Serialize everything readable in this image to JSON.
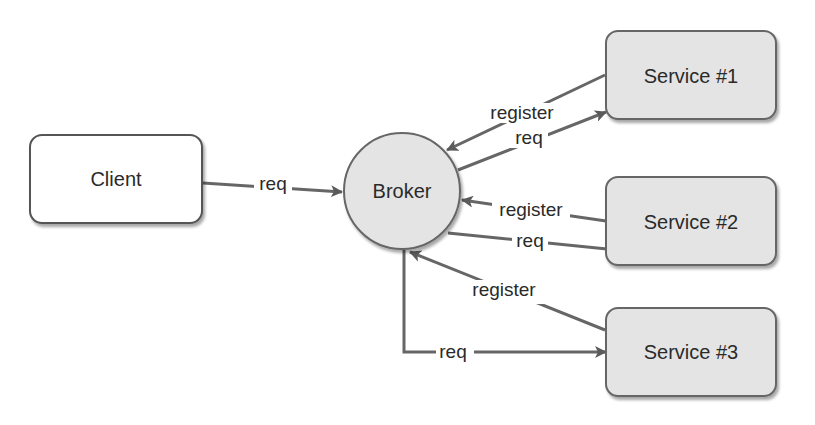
{
  "diagram": {
    "nodes": {
      "client": {
        "label": "Client"
      },
      "broker": {
        "label": "Broker"
      },
      "service1": {
        "label": "Service #1"
      },
      "service2": {
        "label": "Service #2"
      },
      "service3": {
        "label": "Service #3"
      }
    },
    "edges": {
      "client_broker": {
        "label": "req"
      },
      "s1_register": {
        "label": "register"
      },
      "s1_req": {
        "label": "req"
      },
      "s2_register": {
        "label": "register"
      },
      "s2_req": {
        "label": "req"
      },
      "s3_register": {
        "label": "register"
      },
      "s3_req": {
        "label": "req"
      }
    },
    "colors": {
      "node_fill": "#e4e4e4",
      "client_fill": "#ffffff",
      "stroke": "#555555",
      "edge": "#666666",
      "text": "#2a2a2a"
    }
  }
}
